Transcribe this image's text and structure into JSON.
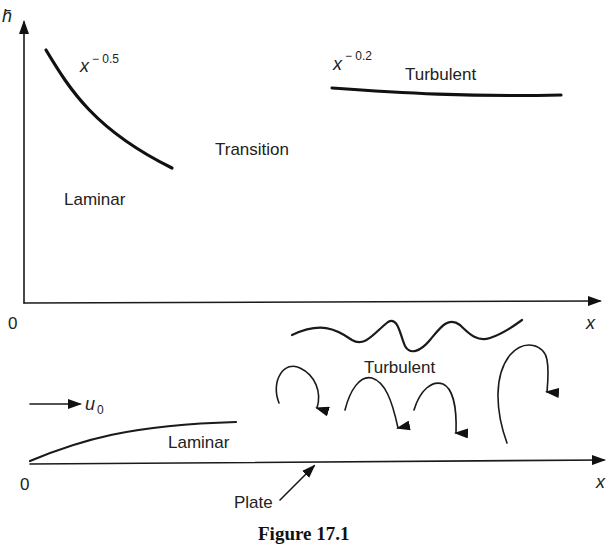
{
  "top_plot": {
    "y_axis_label": "h̄",
    "x_axis_label": "x",
    "origin_label": "0",
    "laminar_exponent_base": "x",
    "laminar_exponent": "− 0.5",
    "turbulent_exponent_base": "x",
    "turbulent_exponent": "− 0.2",
    "region_laminar": "Laminar",
    "region_transition": "Transition",
    "region_turbulent": "Turbulent"
  },
  "bottom_sketch": {
    "freestream_label_base": "u",
    "freestream_label_sub": "0",
    "region_laminar": "Laminar",
    "region_turbulent": "Turbulent",
    "plate_label": "Plate",
    "origin_label": "0",
    "x_axis_label": "x"
  },
  "caption": "Figure 17.1"
}
